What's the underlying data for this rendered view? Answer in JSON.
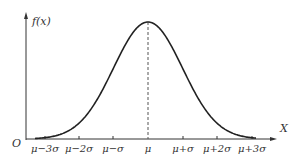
{
  "chart_data": {
    "type": "line",
    "ylabel": "f(x)",
    "xlabel": "X",
    "origin_label": "O",
    "tick_labels": [
      "μ−3σ",
      "μ−2σ",
      "μ−σ",
      "μ",
      "μ+σ",
      "μ+2σ",
      "μ+3σ"
    ],
    "x": [
      -3,
      -2,
      -1,
      0,
      1,
      2,
      3
    ],
    "series": [
      {
        "name": "f(x)",
        "values": [
          0.011,
          0.135,
          0.607,
          1.0,
          0.607,
          0.135,
          0.011
        ]
      }
    ],
    "annotations": [
      "dashed vertical line at x = μ (peak)"
    ],
    "grid": false,
    "legend": "none"
  },
  "labels": {
    "y_axis": "f(x)",
    "x_axis": "X",
    "origin": "O",
    "ticks": [
      "μ−3σ",
      "μ−2σ",
      "μ−σ",
      "μ",
      "μ+σ",
      "μ+2σ",
      "μ+3σ"
    ]
  }
}
